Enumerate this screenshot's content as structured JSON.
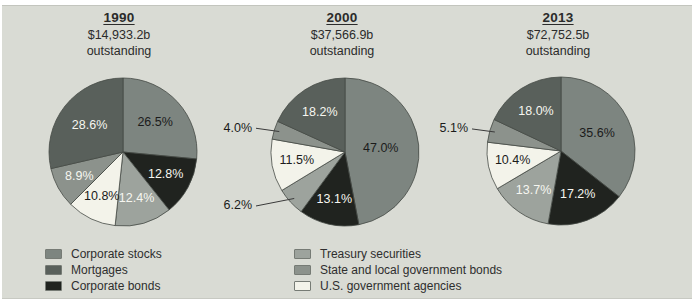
{
  "page": {
    "background": "#ffffff",
    "panel_bg": "#d9dbd4"
  },
  "colors": {
    "corporate_stocks": "#7d8580",
    "mortgages": "#59605b",
    "corporate_bonds": "#20231f",
    "treasury_securities": "#9da39d",
    "state_local_bonds": "#8c928c",
    "us_govt_agencies": "#f3f3ea",
    "slice_outline": "#454a45",
    "label_dark": "#1b1b1b",
    "label_light": "#f6f6f0",
    "callout_line": "#3a3a3a"
  },
  "legend": {
    "columns": [
      {
        "items": [
          {
            "label": "Corporate stocks",
            "color_key": "corporate_stocks"
          },
          {
            "label": "Mortgages",
            "color_key": "mortgages"
          },
          {
            "label": "Corporate bonds",
            "color_key": "corporate_bonds"
          }
        ]
      },
      {
        "items": [
          {
            "label": "Treasury securities",
            "color_key": "treasury_securities"
          },
          {
            "label": "State and local government bonds",
            "color_key": "state_local_bonds"
          },
          {
            "label": "U.S. government agencies",
            "color_key": "us_govt_agencies"
          }
        ]
      }
    ]
  },
  "chart_data": {
    "type": "pie",
    "pie_count": 3,
    "slice_order": "clockwise-from-12-o-clock",
    "legend_position": "bottom",
    "categories": [
      "Corporate stocks",
      "Mortgages",
      "Corporate bonds",
      "Treasury securities",
      "State and local government bonds",
      "U.S. government agencies"
    ],
    "pies": [
      {
        "year": "1990",
        "amount_outstanding": "$14,933.2b",
        "outstanding_label": "outstanding",
        "slices": [
          {
            "category": "Corporate stocks",
            "value": 26.5,
            "label": "26.5%",
            "color_key": "corporate_stocks",
            "text": "dark",
            "placement": "inside"
          },
          {
            "category": "Corporate bonds",
            "value": 12.8,
            "label": "12.8%",
            "color_key": "corporate_bonds",
            "text": "light",
            "placement": "inside"
          },
          {
            "category": "Treasury securities",
            "value": 12.4,
            "label": "12.4%",
            "color_key": "treasury_securities",
            "text": "light",
            "placement": "inside"
          },
          {
            "category": "U.S. government agencies",
            "value": 10.8,
            "label": "10.8%",
            "color_key": "us_govt_agencies",
            "text": "dark",
            "placement": "inside"
          },
          {
            "category": "State and local government bonds",
            "value": 8.9,
            "label": "8.9%",
            "color_key": "state_local_bonds",
            "text": "light",
            "placement": "inside"
          },
          {
            "category": "Mortgages",
            "value": 28.6,
            "label": "28.6%",
            "color_key": "mortgages",
            "text": "light",
            "placement": "inside"
          }
        ]
      },
      {
        "year": "2000",
        "amount_outstanding": "$37,566.9b",
        "outstanding_label": "outstanding",
        "slices": [
          {
            "category": "Corporate stocks",
            "value": 47.0,
            "label": "47.0%",
            "color_key": "corporate_stocks",
            "text": "dark",
            "placement": "inside"
          },
          {
            "category": "Corporate bonds",
            "value": 13.1,
            "label": "13.1%",
            "color_key": "corporate_bonds",
            "text": "light",
            "placement": "inside"
          },
          {
            "category": "Treasury securities",
            "value": 6.2,
            "label": "6.2%",
            "color_key": "treasury_securities",
            "text": "dark",
            "placement": "callout"
          },
          {
            "category": "U.S. government agencies",
            "value": 11.5,
            "label": "11.5%",
            "color_key": "us_govt_agencies",
            "text": "dark",
            "placement": "inside"
          },
          {
            "category": "State and local government bonds",
            "value": 4.0,
            "label": "4.0%",
            "color_key": "state_local_bonds",
            "text": "dark",
            "placement": "callout"
          },
          {
            "category": "Mortgages",
            "value": 18.2,
            "label": "18.2%",
            "color_key": "mortgages",
            "text": "light",
            "placement": "inside"
          }
        ]
      },
      {
        "year": "2013",
        "amount_outstanding": "$72,752.5b",
        "outstanding_label": "outstanding",
        "slices": [
          {
            "category": "Corporate stocks",
            "value": 35.6,
            "label": "35.6%",
            "color_key": "corporate_stocks",
            "text": "dark",
            "placement": "inside"
          },
          {
            "category": "Corporate bonds",
            "value": 17.2,
            "label": "17.2%",
            "color_key": "corporate_bonds",
            "text": "light",
            "placement": "inside"
          },
          {
            "category": "Treasury securities",
            "value": 13.7,
            "label": "13.7%",
            "color_key": "treasury_securities",
            "text": "light",
            "placement": "inside"
          },
          {
            "category": "U.S. government agencies",
            "value": 10.4,
            "label": "10.4%",
            "color_key": "us_govt_agencies",
            "text": "dark",
            "placement": "inside"
          },
          {
            "category": "State and local government bonds",
            "value": 5.1,
            "label": "5.1%",
            "color_key": "state_local_bonds",
            "text": "dark",
            "placement": "callout"
          },
          {
            "category": "Mortgages",
            "value": 18.0,
            "label": "18.0%",
            "color_key": "mortgages",
            "text": "light",
            "placement": "inside"
          }
        ]
      }
    ]
  }
}
